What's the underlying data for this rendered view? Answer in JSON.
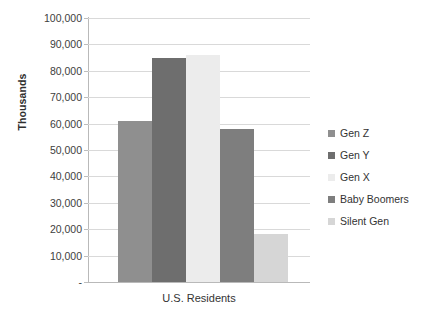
{
  "chart_data": {
    "type": "bar",
    "title": "",
    "xlabel": "U.S. Residents",
    "ylabel": "Thousands",
    "categories": [
      "Gen Z",
      "Gen Y",
      "Gen X",
      "Baby Boomers",
      "Silent Gen"
    ],
    "values": [
      61000,
      85000,
      86000,
      58000,
      18000
    ],
    "ylim": [
      0,
      100000
    ],
    "ytick_labels": [
      "100,000",
      "90,000",
      "80,000",
      "70,000",
      "60,000",
      "50,000",
      "40,000",
      "30,000",
      "20,000",
      "10,000",
      "-"
    ],
    "ytick_values": [
      100000,
      90000,
      80000,
      70000,
      60000,
      50000,
      40000,
      30000,
      20000,
      10000,
      0
    ],
    "grid": true,
    "legend_position": "right",
    "colors": [
      "#8f8f8f",
      "#6e6e6e",
      "#ececec",
      "#7e7e7e",
      "#d6d6d6"
    ],
    "legend": [
      {
        "label": "Gen Z",
        "color": "#8f8f8f"
      },
      {
        "label": "Gen Y",
        "color": "#6e6e6e"
      },
      {
        "label": "Gen X",
        "color": "#ececec"
      },
      {
        "label": "Baby Boomers",
        "color": "#7e7e7e"
      },
      {
        "label": "Silent Gen",
        "color": "#d6d6d6"
      }
    ]
  }
}
